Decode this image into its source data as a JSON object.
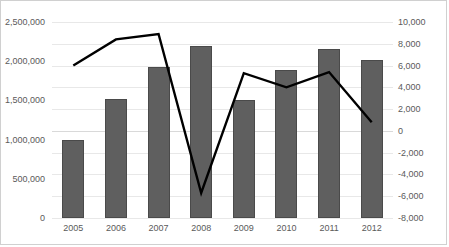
{
  "chart": {
    "type": "combo-bar-line",
    "background_color": "#ffffff",
    "border_color": "#d0d0d0",
    "bar_color": "#5f5f5f",
    "line_color": "#000000",
    "gridline_color": "#e8e8e8",
    "tick_text_color": "#5a5a5a"
  },
  "chart_data": {
    "type": "bar",
    "title": "",
    "subtitle": "",
    "xlabel": "",
    "ylabel": "",
    "grid": true,
    "legend": "none",
    "categories": [
      "2005",
      "2006",
      "2007",
      "2008",
      "2009",
      "2010",
      "2011",
      "2012"
    ],
    "series": [
      {
        "name": "bars",
        "type": "bar",
        "axis": "left",
        "values": [
          1000000,
          1520000,
          1920000,
          2200000,
          1500000,
          1890000,
          2150000,
          2020000
        ]
      },
      {
        "name": "line",
        "type": "line",
        "axis": "right",
        "values": [
          6000,
          8400,
          8900,
          -5700,
          5300,
          4000,
          5400,
          800
        ]
      }
    ],
    "ylim": [
      0,
      2500000
    ],
    "y2lim": [
      -8000,
      10000
    ],
    "yticks": [
      0,
      500000,
      1000000,
      1500000,
      2000000,
      2500000
    ],
    "y2ticks": [
      -8000,
      -6000,
      -4000,
      -2000,
      0,
      2000,
      4000,
      6000,
      8000,
      10000
    ],
    "ytick_labels": [
      "0",
      "500,000",
      "1,000,000",
      "1,500,000",
      "2,000,000",
      "2,500,000"
    ],
    "y2tick_labels": [
      "-8,000",
      "-6,000",
      "-4,000",
      "-2,000",
      "0",
      "2,000",
      "4,000",
      "6,000",
      "8,000",
      "10,000"
    ]
  }
}
